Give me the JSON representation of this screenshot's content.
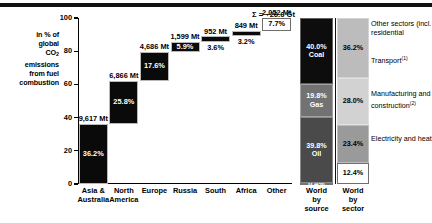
{
  "axis_caption": {
    "line1": "in % of",
    "line2": "global",
    "line3_pre": "CO",
    "line3_sub": "2",
    "line4": "emissions",
    "line5": "from fuel",
    "line6": "combustion"
  },
  "sum_label": "Σ = ~26.6 Gt",
  "legend": {
    "other_sectors": "Other sectors (incl. residential",
    "transport": "Transport",
    "transport_note": "(1)",
    "manufacturing": "Manufacturing and construction",
    "manufacturing_note": "(2)",
    "electricity": "Electricity and heat"
  },
  "chart_data": {
    "type": "bar",
    "subtype": "waterfall-plus-stacked",
    "title": "",
    "xlabel": "",
    "ylabel": "in % of global CO2 emissions from fuel combustion",
    "ylim": [
      0,
      100
    ],
    "yticks": [
      0,
      20,
      40,
      60,
      80,
      100
    ],
    "grid": false,
    "legend_position": "right",
    "total_annotation": "Σ = ~26.6 Gt",
    "waterfall": {
      "categories": [
        "Asia & Australia",
        "North America",
        "Europe",
        "Russia",
        "South",
        "Africa",
        "Other"
      ],
      "category_lines": [
        [
          "Asia &",
          "Australia"
        ],
        [
          "North",
          "America"
        ],
        [
          "Europe"
        ],
        [
          "Russia"
        ],
        [
          "South"
        ],
        [
          "Africa"
        ],
        [
          "Other"
        ]
      ],
      "absolute_mt": [
        9617,
        6866,
        4686,
        1599,
        952,
        849,
        2052
      ],
      "absolute_labels": [
        "9,617 Mt",
        "6,866 Mt",
        "4,686 Mt",
        "1,599 Mt",
        "952 Mt",
        "849 Mt",
        "2,052 Mt"
      ],
      "percent": [
        36.2,
        25.8,
        17.6,
        5.9,
        3.6,
        3.2,
        7.7
      ],
      "percent_labels": [
        "36.2%",
        "25.8%",
        "17.6%",
        "5.9%",
        "3.6%",
        "3.2%",
        "7.7%"
      ],
      "cumulative_base": [
        0,
        36.2,
        62.0,
        79.6,
        85.5,
        89.1,
        92.3
      ],
      "styles": [
        "dark",
        "dark",
        "dark",
        "dark",
        "dark",
        "dark",
        "light"
      ],
      "label_placement": [
        "inside",
        "inside",
        "inside",
        "inside",
        "below",
        "below",
        "inside-dk"
      ]
    },
    "stacked": [
      {
        "name": "World by source",
        "name_lines": [
          "World",
          "by",
          "source"
        ],
        "segments": [
          {
            "label": "0.4%",
            "name": "",
            "value": 0.4,
            "color": "#2b2b2b",
            "text_color": "#ffffff"
          },
          {
            "label": "39.8%",
            "name": "Oil",
            "value": 39.8,
            "color": "#4a4a4a",
            "text_color": "#ffffff"
          },
          {
            "label": "19.8%",
            "name": "Gas",
            "value": 19.8,
            "color": "#727272",
            "text_color": "#ffffff"
          },
          {
            "label": "40.0%",
            "name": "Coal",
            "value": 40.0,
            "color": "#0d0d0d",
            "text_color": "#ffffff"
          }
        ]
      },
      {
        "name": "World by sector",
        "name_lines": [
          "World",
          "by",
          "sector"
        ],
        "segments": [
          {
            "label": "12.4%",
            "name": "",
            "value": 12.4,
            "color": "#ffffff",
            "text_color": "#000000"
          },
          {
            "label": "23.4%",
            "name": "",
            "value": 23.4,
            "color": "#9a9a9a",
            "text_color": "#000000"
          },
          {
            "label": "28.0%",
            "name": "",
            "value": 28.0,
            "color": "#d2d2d2",
            "text_color": "#000000"
          },
          {
            "label": "36.2%",
            "name": "",
            "value": 36.2,
            "color": "#bcbcbc",
            "text_color": "#000000"
          }
        ]
      }
    ]
  }
}
